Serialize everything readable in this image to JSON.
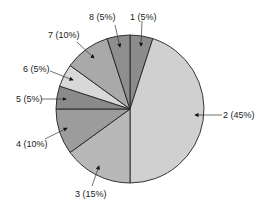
{
  "chart_data": {
    "type": "pie",
    "title": "",
    "start_angle": "12 o'clock",
    "direction": "clockwise",
    "slices": [
      {
        "id": "1",
        "label": "1 (5%)",
        "value": 5,
        "color": "#8c8c8c"
      },
      {
        "id": "2",
        "label": "2 (45%)",
        "value": 45,
        "color": "#d0d0d0"
      },
      {
        "id": "3",
        "label": "3 (15%)",
        "value": 15,
        "color": "#b8b8b8"
      },
      {
        "id": "4",
        "label": "4 (10%)",
        "value": 10,
        "color": "#9c9c9c"
      },
      {
        "id": "5",
        "label": "5 (5%)",
        "value": 5,
        "color": "#8a8a8a"
      },
      {
        "id": "6",
        "label": "6 (5%)",
        "value": 5,
        "color": "#d8d8d8"
      },
      {
        "id": "7",
        "label": "7 (10%)",
        "value": 10,
        "color": "#a9a9a9"
      },
      {
        "id": "8",
        "label": "8 (5%)",
        "value": 5,
        "color": "#8e8e8e"
      }
    ],
    "legend": "none (callout labels with arrows)"
  },
  "labels": {
    "s1": "1 (5%)",
    "s2": "2 (45%)",
    "s3": "3 (15%)",
    "s4": "4 (10%)",
    "s5": "5 (5%)",
    "s6": "6 (5%)",
    "s7": "7 (10%)",
    "s8": "8 (5%)"
  }
}
